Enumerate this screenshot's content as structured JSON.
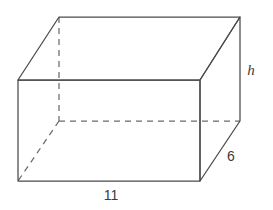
{
  "figure": {
    "shape_type": "rectangular-prism",
    "stroke_color": "#4a4a4a",
    "hidden_stroke_color": "#6b6b6b",
    "background_color": "#ffffff",
    "labels": {
      "height": "h",
      "depth": "6",
      "width": "11"
    },
    "label_positions": {
      "height": {
        "x": 251,
        "y": 72
      },
      "depth": {
        "x": 231,
        "y": 157
      },
      "width": {
        "x": 111,
        "y": 196
      }
    },
    "vertices": {
      "front_top_left": {
        "x": 18,
        "y": 80
      },
      "front_top_right": {
        "x": 200,
        "y": 80
      },
      "front_bottom_right": {
        "x": 200,
        "y": 181
      },
      "front_bottom_left": {
        "x": 18,
        "y": 181
      },
      "back_top_left": {
        "x": 59,
        "y": 17
      },
      "back_top_right": {
        "x": 240,
        "y": 17
      },
      "back_bottom_right": {
        "x": 240,
        "y": 121
      },
      "back_bottom_left": {
        "x": 59,
        "y": 121
      }
    },
    "edges": {
      "front_face_path": "M 18 80 L 200 80 L 200 181 L 18 181 Z",
      "top_face_path": "M 18 80 L 59 17 L 240 17 L 200 80 Z",
      "right_face_path": "M 200 80 L 240 17 L 240 121 L 200 181 Z",
      "hidden_vertical_path": "M 59 17 L 59 121",
      "hidden_horizontal_path": "M 59 121 L 240 121",
      "hidden_diagonal_path": "M 59 121 L 18 181"
    }
  }
}
